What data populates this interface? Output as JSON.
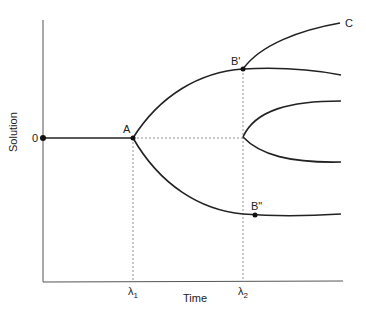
{
  "diagram": {
    "x_axis_label": "Time",
    "y_axis_label": "Solution",
    "origin_label": "0",
    "x_ticks": [
      {
        "label": "λ",
        "sub": "1"
      },
      {
        "label": "λ",
        "sub": "2"
      }
    ],
    "points": {
      "A": "A",
      "B_prime": "B'",
      "B_double_prime": "B\"",
      "C": "C"
    },
    "colors": {
      "curve": "#222222",
      "axis": "#555555",
      "dashed": "#777777"
    }
  }
}
